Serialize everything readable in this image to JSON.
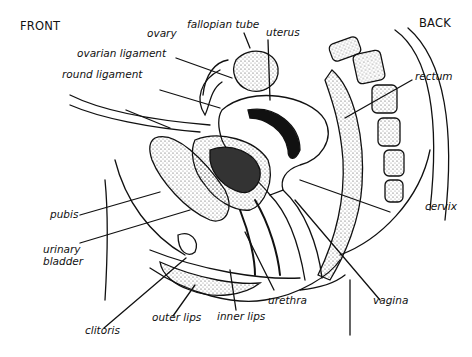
{
  "diagram": {
    "orientation": {
      "front": "FRONT",
      "back": "BACK"
    },
    "labels": {
      "ovary": "ovary",
      "fallopian_tube": "fallopian tube",
      "uterus": "uterus",
      "ovarian_ligament": "ovarian ligament",
      "round_ligament": "round ligament",
      "rectum": "rectum",
      "pubis": "pubis",
      "urinary_bladder_1": "urinary",
      "urinary_bladder_2": "bladder",
      "cervix": "cervix",
      "clitoris": "clitoris",
      "outer_lips": "outer lips",
      "inner_lips": "inner lips",
      "urethra": "urethra",
      "vagina": "vagina"
    },
    "colors": {
      "ink": "#111111",
      "stipple": "#555555",
      "background": "#ffffff"
    }
  }
}
